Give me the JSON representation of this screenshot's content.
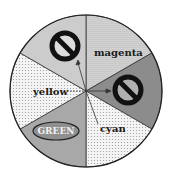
{
  "diagram": {
    "type": "color-wheel",
    "sectors": [
      {
        "label": "magenta",
        "fill": "#d4d4d4",
        "pattern": "dots",
        "start": -90,
        "end": -30
      },
      {
        "label": "",
        "fill": "#8c8c8c",
        "pattern": "none",
        "start": -30,
        "end": 30
      },
      {
        "label": "cyan",
        "fill": "#f0f0f0",
        "pattern": "dots",
        "start": 30,
        "end": 90
      },
      {
        "label": "GREEN",
        "fill": "#a8a8a8",
        "pattern": "none",
        "start": 90,
        "end": 150
      },
      {
        "label": "yellow",
        "fill": "#e6e6e6",
        "pattern": "dots",
        "start": 150,
        "end": 210
      },
      {
        "label": "",
        "fill": "#c8c8c8",
        "pattern": "none",
        "start": 210,
        "end": 270
      }
    ],
    "labels": {
      "magenta": "magenta",
      "cyan": "cyan",
      "green": "GREEN",
      "yellow": "yellow"
    },
    "icons": {
      "prohibited_top": "no-symbol-icon",
      "prohibited_right": "no-symbol-icon"
    },
    "colors": {
      "outline": "#222222",
      "dark_sector": "#8c8c8c",
      "green_sector": "#a8a8a8"
    }
  }
}
